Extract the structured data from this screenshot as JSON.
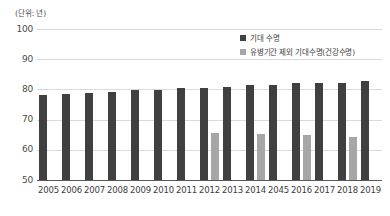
{
  "unit_caption": "(단위: 년)",
  "legend": {
    "position": "top-right",
    "items": [
      {
        "label": "기대 수명",
        "color": "#404040",
        "swatch": "square-marker-icon"
      },
      {
        "label": "유병기간 제외 기대수명(건강수명)",
        "color": "#a6a6a6",
        "swatch": "square-marker-icon"
      }
    ]
  },
  "colors": {
    "primary_bar": "#404040",
    "secondary_bar": "#a6a6a6",
    "gridline": "#d9d9d9",
    "axis": "#595959",
    "background": "#ffffff",
    "text": "#3c3c3c"
  },
  "chart_data": {
    "type": "bar",
    "title": "",
    "subtitle": "",
    "xlabel": "",
    "ylabel": "",
    "unit": "(단위: 년)",
    "ylim": [
      50,
      100
    ],
    "yticks": [
      50,
      60,
      70,
      80,
      90,
      100
    ],
    "ytick_labels": [
      "50",
      "60",
      "70",
      "80",
      "90",
      "100"
    ],
    "grid": true,
    "legend_position": "top-right",
    "categories": [
      "2005",
      "2006",
      "2007",
      "2008",
      "2009",
      "2010",
      "2011",
      "2012",
      "2013",
      "2014",
      "2045",
      "2016",
      "2017",
      "2018",
      "2019"
    ],
    "series": [
      {
        "name": "기대 수명",
        "color": "#404040",
        "values": [
          78.2,
          78.5,
          78.8,
          79.2,
          79.7,
          79.8,
          80.4,
          80.5,
          80.9,
          81.3,
          81.4,
          82.0,
          82.1,
          82.1,
          82.7
        ]
      },
      {
        "name": "유병기간 제외 기대수명(건강수명)",
        "color": "#a6a6a6",
        "values": [
          null,
          null,
          null,
          null,
          null,
          null,
          null,
          65.7,
          null,
          65.4,
          null,
          64.9,
          null,
          64.4,
          null
        ]
      }
    ]
  }
}
